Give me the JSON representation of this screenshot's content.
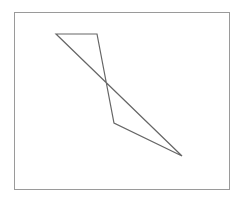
{
  "figure": {
    "frame": {
      "x": 14,
      "y": 12,
      "width": 215,
      "height": 177,
      "stroke": "#9a9a9a"
    },
    "shape": {
      "type": "closed-polyline",
      "stroke": "#666666",
      "points": [
        [
          56,
          34
        ],
        [
          97,
          34
        ],
        [
          114,
          123
        ],
        [
          182,
          156
        ]
      ]
    }
  }
}
